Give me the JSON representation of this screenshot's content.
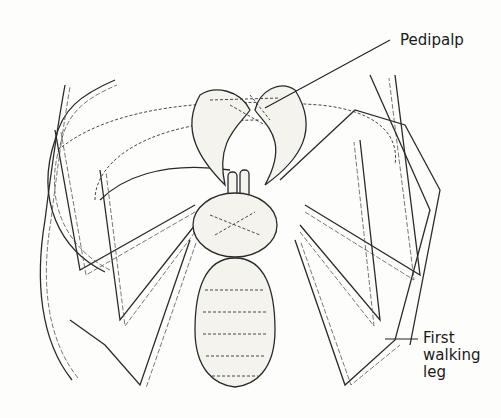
{
  "figure": {
    "labels": [
      {
        "id": "pedipalp",
        "text": "Pedipalp"
      },
      {
        "id": "first-walking-leg",
        "lines": [
          "First",
          "walking",
          "leg"
        ]
      }
    ]
  }
}
